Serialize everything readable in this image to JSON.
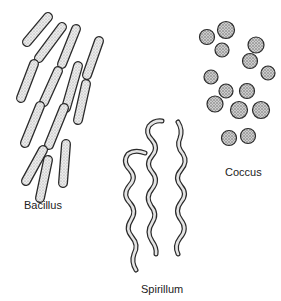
{
  "diagram": {
    "groups": [
      {
        "id": "bacillus",
        "label": "Bacillus",
        "shape": "rod",
        "count": 13
      },
      {
        "id": "spirillum",
        "label": "Spirillum",
        "shape": "spiral",
        "count": 3
      },
      {
        "id": "coccus",
        "label": "Coccus",
        "shape": "sphere",
        "count": 15
      }
    ]
  },
  "colors": {
    "background": "#ffffff",
    "outline": "#2a2a2a",
    "fill": "#e6e6e6",
    "stipple": "#7a7a7a",
    "text": "#222222"
  }
}
